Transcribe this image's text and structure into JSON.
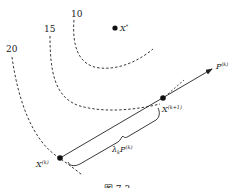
{
  "diagram": {
    "contours": [
      {
        "label": "10"
      },
      {
        "label": "15"
      },
      {
        "label": "20"
      }
    ],
    "optimum": {
      "label": "X",
      "sup": "*"
    },
    "current_point": {
      "label": "X",
      "sup": "(k)"
    },
    "next_point": {
      "label": "X",
      "sup": "(k+1)"
    },
    "direction": {
      "label": "P",
      "sup": "(k)"
    },
    "step": {
      "lambda": "λ",
      "sub": "k",
      "label": "P",
      "sup": "(k)"
    },
    "caption": "图 7.3"
  },
  "colors": {
    "ink": "#222222",
    "background": "#ffffff"
  }
}
